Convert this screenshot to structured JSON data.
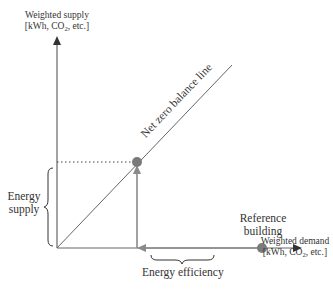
{
  "diagram": {
    "y_axis": {
      "label_line1": "Weighted supply",
      "label_line2_pre": "[kWh, CO",
      "label_line2_sub": "2",
      "label_line2_post": ", etc.]"
    },
    "x_axis": {
      "label_line1": "Weighted demand",
      "label_line2_pre": "[kWh, CO",
      "label_line2_sub": "2",
      "label_line2_post": ", etc.]"
    },
    "balance_line_label": "Net zero balance line",
    "reference_building": {
      "line1": "Reference",
      "line2": "building"
    },
    "energy_supply": {
      "line1": "Energy",
      "line2": "supply"
    },
    "energy_efficiency": "Energy efficiency",
    "colors": {
      "axis": "#555555",
      "arrow_gray": "#8a8a8a",
      "dot": "#7a7a7a",
      "text": "#333333"
    }
  }
}
